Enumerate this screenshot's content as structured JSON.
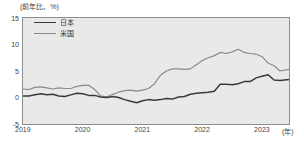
{
  "chart_data": {
    "type": "line",
    "title": "",
    "unit_note": "(前年比、%)",
    "xlabel": "(年)",
    "ylabel": "",
    "ylim": [
      -5,
      15
    ],
    "yticks": [
      15,
      10,
      5,
      0,
      -5
    ],
    "xticks": [
      "2019",
      "2020",
      "2021",
      "2022",
      "2023"
    ],
    "grid": false,
    "legend_position": "top-left",
    "x_start": 2019.0,
    "x_end": 2023.45,
    "series": [
      {
        "name": "日本",
        "color": "#3a3a3a",
        "x": [
          2019.0,
          2019.1,
          2019.2,
          2019.3,
          2019.4,
          2019.5,
          2019.6,
          2019.7,
          2019.8,
          2019.9,
          2020.0,
          2020.1,
          2020.2,
          2020.3,
          2020.4,
          2020.5,
          2020.6,
          2020.7,
          2020.8,
          2020.9,
          2021.0,
          2021.1,
          2021.2,
          2021.3,
          2021.4,
          2021.5,
          2021.6,
          2021.7,
          2021.8,
          2021.9,
          2022.0,
          2022.1,
          2022.2,
          2022.3,
          2022.4,
          2022.5,
          2022.6,
          2022.7,
          2022.8,
          2022.9,
          2023.0,
          2023.1,
          2023.2,
          2023.3,
          2023.45
        ],
        "values": [
          0.3,
          0.3,
          0.5,
          0.7,
          0.5,
          0.6,
          0.3,
          0.2,
          0.5,
          0.8,
          0.7,
          0.4,
          0.4,
          0.1,
          0.0,
          0.2,
          0.0,
          -0.4,
          -0.7,
          -1.0,
          -0.6,
          -0.4,
          -0.5,
          -0.4,
          -0.2,
          -0.3,
          0.1,
          0.2,
          0.6,
          0.8,
          0.9,
          1.0,
          1.2,
          2.5,
          2.5,
          2.4,
          2.6,
          3.0,
          3.0,
          3.7,
          4.0,
          4.3,
          3.3,
          3.2,
          3.4
        ]
      },
      {
        "name": "米国",
        "color": "#8a8a8a",
        "x": [
          2019.0,
          2019.1,
          2019.2,
          2019.3,
          2019.4,
          2019.5,
          2019.6,
          2019.7,
          2019.8,
          2019.9,
          2020.0,
          2020.1,
          2020.2,
          2020.3,
          2020.4,
          2020.5,
          2020.6,
          2020.7,
          2020.8,
          2020.9,
          2021.0,
          2021.1,
          2021.2,
          2021.3,
          2021.4,
          2021.5,
          2021.6,
          2021.7,
          2021.8,
          2021.9,
          2022.0,
          2022.1,
          2022.2,
          2022.3,
          2022.4,
          2022.5,
          2022.6,
          2022.7,
          2022.8,
          2022.9,
          2023.0,
          2023.1,
          2023.2,
          2023.3,
          2023.45
        ],
        "values": [
          1.6,
          1.5,
          1.9,
          2.0,
          1.8,
          1.6,
          1.8,
          1.7,
          1.7,
          2.1,
          2.3,
          2.3,
          1.5,
          0.3,
          0.1,
          0.6,
          1.0,
          1.3,
          1.4,
          1.2,
          1.4,
          1.7,
          2.6,
          4.2,
          5.0,
          5.4,
          5.4,
          5.3,
          5.4,
          6.2,
          7.0,
          7.5,
          7.9,
          8.5,
          8.3,
          8.6,
          9.1,
          8.5,
          8.3,
          8.2,
          7.7,
          6.5,
          6.0,
          5.0,
          5.3
        ]
      }
    ]
  },
  "legend": {
    "items": [
      {
        "label": "日本",
        "key": "jp"
      },
      {
        "label": "米国",
        "key": "us"
      }
    ]
  },
  "axes": {
    "unit_top": "(前年比、%)",
    "unit_right": "(年)",
    "y_labels": [
      "15",
      "10",
      "5",
      "0",
      "-5"
    ],
    "x_labels": [
      "2019",
      "2020",
      "2021",
      "2022",
      "2023"
    ]
  },
  "source_note": ""
}
